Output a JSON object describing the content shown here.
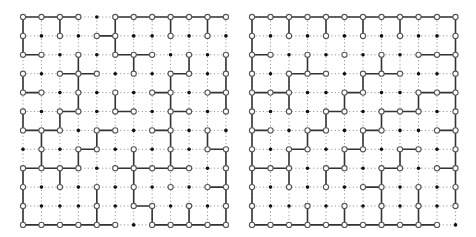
{
  "figure": {
    "colors": {
      "edge": "#333333",
      "dotted": "#9a9a9a",
      "open_node_fill": "#ffffff",
      "open_node_stroke": "#555555",
      "filled_node": "#111111"
    },
    "grids": [
      {
        "name": "left-grid",
        "origin": [
          23,
          17
        ],
        "step": [
          18.45,
          18.9
        ],
        "nodes": [
          "oooo.ooooooo",
          "o.o.oo..o.o.",
          "oo.o.ooo.o.o",
          "o.ooo.o.oo.o",
          "oo.o.o.oo.oo",
          "o.oo.oo.oo.o",
          "ooo.oo.oo.o.",
          ".o.oo.o.o.oo",
          "oooo.ooooo.o",
          "o.o.o.o.o.oo",
          "o...o.oo.o.o",
          "oooooo.ooooo"
        ],
        "h_edges": [
          [
            0,
            0
          ],
          [
            0,
            1
          ],
          [
            0,
            2
          ],
          [
            0,
            5
          ],
          [
            0,
            6
          ],
          [
            0,
            7
          ],
          [
            0,
            8
          ],
          [
            0,
            9
          ],
          [
            0,
            10
          ],
          [
            1,
            4
          ],
          [
            2,
            0
          ],
          [
            2,
            5
          ],
          [
            2,
            6
          ],
          [
            3,
            2
          ],
          [
            3,
            3
          ],
          [
            3,
            8
          ],
          [
            4,
            0
          ],
          [
            4,
            7
          ],
          [
            4,
            10
          ],
          [
            5,
            2
          ],
          [
            5,
            5
          ],
          [
            5,
            8
          ],
          [
            6,
            0
          ],
          [
            6,
            1
          ],
          [
            6,
            4
          ],
          [
            6,
            7
          ],
          [
            7,
            3
          ],
          [
            7,
            10
          ],
          [
            8,
            0
          ],
          [
            8,
            1
          ],
          [
            8,
            2
          ],
          [
            8,
            5
          ],
          [
            8,
            6
          ],
          [
            8,
            7
          ],
          [
            8,
            8
          ],
          [
            9,
            10
          ],
          [
            10,
            6
          ],
          [
            11,
            0
          ],
          [
            11,
            1
          ],
          [
            11,
            2
          ],
          [
            11,
            3
          ],
          [
            11,
            4
          ],
          [
            11,
            7
          ],
          [
            11,
            8
          ],
          [
            11,
            9
          ],
          [
            11,
            10
          ]
        ],
        "v_edges": [
          [
            0,
            0
          ],
          [
            1,
            0
          ],
          [
            3,
            0
          ],
          [
            5,
            0
          ],
          [
            0,
            2
          ],
          [
            0,
            5
          ],
          [
            1,
            5
          ],
          [
            4,
            5
          ],
          [
            0,
            8
          ],
          [
            0,
            10
          ],
          [
            2,
            3
          ],
          [
            3,
            3
          ],
          [
            4,
            3
          ],
          [
            2,
            6
          ],
          [
            2,
            9
          ],
          [
            2,
            11
          ],
          [
            3,
            11
          ],
          [
            4,
            11
          ],
          [
            3,
            8
          ],
          [
            4,
            8
          ],
          [
            5,
            8
          ],
          [
            6,
            8
          ],
          [
            7,
            8
          ],
          [
            5,
            2
          ],
          [
            6,
            1
          ],
          [
            6,
            4
          ],
          [
            6,
            10
          ],
          [
            7,
            1
          ],
          [
            7,
            3
          ],
          [
            7,
            6
          ],
          [
            7,
            11
          ],
          [
            8,
            11
          ],
          [
            9,
            11
          ],
          [
            10,
            11
          ],
          [
            8,
            0
          ],
          [
            9,
            0
          ],
          [
            10,
            0
          ],
          [
            8,
            2
          ],
          [
            8,
            6
          ],
          [
            9,
            6
          ],
          [
            9,
            4
          ],
          [
            10,
            4
          ],
          [
            10,
            7
          ],
          [
            10,
            9
          ]
        ]
      },
      {
        "name": "right-grid",
        "origin": [
          252,
          17
        ],
        "step": [
          18.5,
          18.9
        ],
        "nodes": [
          "oooooooooooo",
          "o.o.o.o.o..o",
          "oo.o.o.o.ooo",
          "o.ooo.ooo..o",
          "ooo..oo..ooo",
          "o.o.oo.ooo.o",
          "oo.oo.oo..oo",
          "o.oo.oo.oo.o",
          "ooo.oo.oo.oo",
          "o.o.o.oo.o.o",
          "o..o.o.o.o.o",
          "ooooooooooo."
        ],
        "h_edges": [
          [
            0,
            0
          ],
          [
            0,
            1
          ],
          [
            0,
            2
          ],
          [
            0,
            3
          ],
          [
            0,
            4
          ],
          [
            0,
            5
          ],
          [
            0,
            6
          ],
          [
            0,
            7
          ],
          [
            0,
            8
          ],
          [
            0,
            9
          ],
          [
            0,
            10
          ],
          [
            2,
            0
          ],
          [
            2,
            9
          ],
          [
            2,
            10
          ],
          [
            3,
            2
          ],
          [
            3,
            3
          ],
          [
            3,
            6
          ],
          [
            3,
            7
          ],
          [
            4,
            0
          ],
          [
            4,
            1
          ],
          [
            4,
            5
          ],
          [
            4,
            9
          ],
          [
            4,
            10
          ],
          [
            5,
            4
          ],
          [
            5,
            7
          ],
          [
            5,
            8
          ],
          [
            6,
            0
          ],
          [
            6,
            3
          ],
          [
            6,
            6
          ],
          [
            6,
            10
          ],
          [
            7,
            2
          ],
          [
            7,
            5
          ],
          [
            7,
            8
          ],
          [
            8,
            0
          ],
          [
            8,
            1
          ],
          [
            8,
            4
          ],
          [
            8,
            7
          ],
          [
            8,
            10
          ],
          [
            9,
            6
          ],
          [
            11,
            0
          ],
          [
            11,
            1
          ],
          [
            11,
            2
          ],
          [
            11,
            3
          ],
          [
            11,
            4
          ],
          [
            11,
            5
          ],
          [
            11,
            6
          ],
          [
            11,
            7
          ],
          [
            11,
            8
          ],
          [
            11,
            9
          ]
        ],
        "v_edges": [
          [
            0,
            0
          ],
          [
            1,
            0
          ],
          [
            2,
            0
          ],
          [
            3,
            0
          ],
          [
            4,
            0
          ],
          [
            5,
            0
          ],
          [
            6,
            0
          ],
          [
            7,
            0
          ],
          [
            8,
            0
          ],
          [
            9,
            0
          ],
          [
            10,
            0
          ],
          [
            0,
            2
          ],
          [
            0,
            4
          ],
          [
            0,
            6
          ],
          [
            0,
            8
          ],
          [
            0,
            11
          ],
          [
            1,
            11
          ],
          [
            2,
            11
          ],
          [
            3,
            11
          ],
          [
            4,
            11
          ],
          [
            5,
            11
          ],
          [
            6,
            11
          ],
          [
            7,
            11
          ],
          [
            8,
            11
          ],
          [
            9,
            11
          ],
          [
            2,
            3
          ],
          [
            2,
            7
          ],
          [
            3,
            2
          ],
          [
            4,
            2
          ],
          [
            3,
            6
          ],
          [
            4,
            5
          ],
          [
            4,
            9
          ],
          [
            5,
            4
          ],
          [
            5,
            7
          ],
          [
            6,
            3
          ],
          [
            6,
            6
          ],
          [
            7,
            2
          ],
          [
            8,
            2
          ],
          [
            7,
            5
          ],
          [
            7,
            8
          ],
          [
            8,
            4
          ],
          [
            8,
            7
          ],
          [
            9,
            7
          ],
          [
            10,
            7
          ],
          [
            9,
            9
          ],
          [
            10,
            9
          ],
          [
            10,
            3
          ],
          [
            10,
            5
          ]
        ]
      }
    ]
  }
}
